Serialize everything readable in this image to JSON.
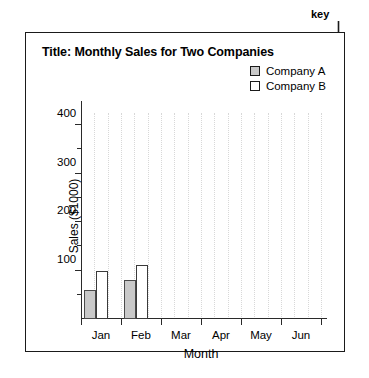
{
  "annotation": {
    "key_label": "key"
  },
  "figure": {
    "title": "Title: Monthly Sales for Two Companies"
  },
  "legend": {
    "position": "top-right",
    "entries": [
      {
        "label": "Company A",
        "swatch": "filled",
        "color": "#c9c9c9"
      },
      {
        "label": "Company B",
        "swatch": "empty",
        "color": "#ffffff"
      }
    ]
  },
  "chart_data": {
    "type": "bar",
    "title": "Title: Monthly Sales for Two Companies",
    "xlabel": "Month",
    "ylabel": "Sales ($1000)",
    "categories": [
      "Jan",
      "Feb",
      "Mar",
      "Apr",
      "May",
      "Jun"
    ],
    "series": [
      {
        "name": "Company A",
        "values": [
          60,
          80,
          0,
          0,
          0,
          0
        ],
        "color": "#c9c9c9"
      },
      {
        "name": "Company B",
        "values": [
          100,
          112,
          0,
          0,
          0,
          0
        ],
        "color": "#ffffff"
      }
    ],
    "ylim": [
      0,
      425
    ],
    "ymajor_ticks": [
      100,
      200,
      300,
      400
    ],
    "yminor_ticks": [
      50,
      150,
      250,
      350
    ],
    "ytick_labels": [
      "100",
      "200",
      "300",
      "400"
    ],
    "grid": "vertical-dotted",
    "legend_position": "top-right"
  }
}
